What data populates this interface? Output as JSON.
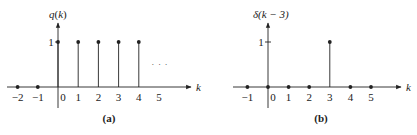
{
  "colors": {
    "ink": "#222222",
    "background": "#ffffff"
  },
  "panels": [
    {
      "id": "a",
      "caption": "(a)",
      "ylabel": "q(k)",
      "ylabel_fn": "q",
      "ylabel_arg": "k",
      "xlabel": "k",
      "level_label": "1",
      "ellipsis": "· · ·",
      "tick_labels": [
        "−2",
        "−1",
        "0",
        "1",
        "2",
        "3",
        "4",
        "5"
      ]
    },
    {
      "id": "b",
      "caption": "(b)",
      "ylabel": "δ(k − 3)",
      "xlabel": "k",
      "level_label": "1",
      "tick_labels": [
        "−1",
        "0",
        "1",
        "2",
        "3",
        "4",
        "5"
      ]
    }
  ],
  "chart_data": [
    {
      "type": "stem",
      "title": "(a)",
      "ylabel": "q(k)",
      "xlabel": "k",
      "x": [
        -2,
        -1,
        0,
        1,
        2,
        3,
        4
      ],
      "values": [
        0,
        0,
        1,
        1,
        1,
        1,
        1
      ],
      "continues": "...",
      "ylim": [
        0,
        1
      ],
      "xticks": [
        -2,
        -1,
        0,
        1,
        2,
        3,
        4,
        5
      ]
    },
    {
      "type": "stem",
      "title": "(b)",
      "ylabel": "δ(k − 3)",
      "xlabel": "k",
      "x": [
        -1,
        0,
        1,
        2,
        3,
        4,
        5
      ],
      "values": [
        0,
        0,
        0,
        0,
        1,
        0,
        0
      ],
      "ylim": [
        0,
        1
      ],
      "xticks": [
        -1,
        0,
        1,
        2,
        3,
        4,
        5
      ]
    }
  ]
}
